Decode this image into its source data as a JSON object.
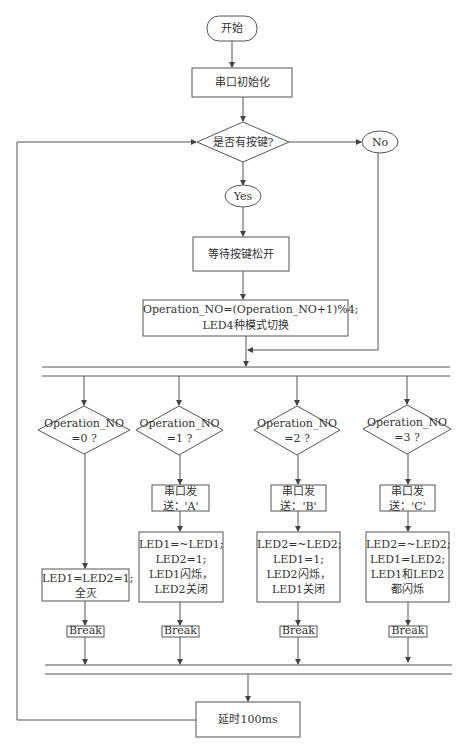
{
  "flowchart": {
    "start": "开始",
    "init": "串口初始化",
    "decision_key": "是否有按键?",
    "no_label": "No",
    "yes_label": "Yes",
    "wait_release": "等待按键松开",
    "operation_line1": "Operation_NO=(Operation_NO+1)%4;",
    "operation_line2": "LED4种模式切换",
    "branches": [
      {
        "cond_line1": "Operation_NO",
        "cond_line2": "=0 ?",
        "send_line1": "",
        "send_line2": "",
        "action_lines": [
          "LED1=LED2=1;",
          "全灭"
        ],
        "break": "Break"
      },
      {
        "cond_line1": "Operation_NO",
        "cond_line2": "=1 ?",
        "send_line1": "串口发",
        "send_line2": "送：'A'",
        "action_lines": [
          "LED1=~LED1;",
          "LED2=1;",
          "LED1闪烁，",
          "LED2关闭"
        ],
        "break": "Break"
      },
      {
        "cond_line1": "Operation_NO",
        "cond_line2": "=2 ?",
        "send_line1": "串口发",
        "send_line2": "送：'B'",
        "action_lines": [
          "LED2=~LED2;",
          "LED1=1;",
          "LED2闪烁，",
          "LED1关闭"
        ],
        "break": "Break"
      },
      {
        "cond_line1": "Operation_NO",
        "cond_line2": "=3 ?",
        "send_line1": "串口发",
        "send_line2": "送：'C'",
        "action_lines": [
          "LED2=~LED2;",
          "LED1=LED2;",
          "LED1和LED2",
          "都闪烁"
        ],
        "break": "Break"
      }
    ],
    "delay": "延时100ms",
    "line_color": "#555555"
  }
}
